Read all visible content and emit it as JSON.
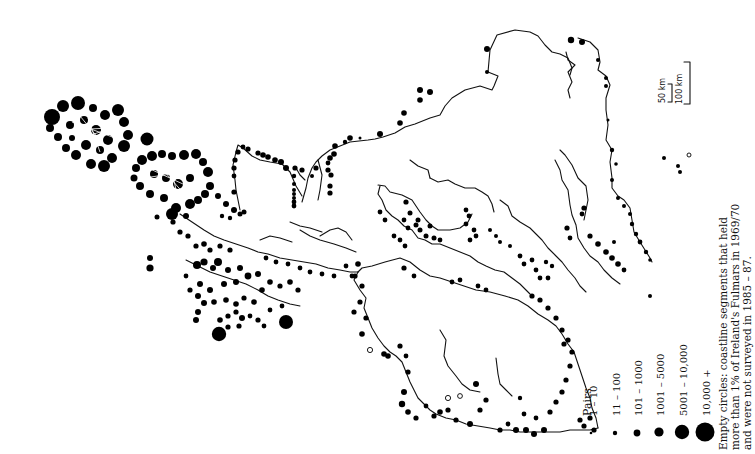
{
  "map": {
    "subject": "Fulmar breeding colonies, coastline of Ireland (rotated 90°)",
    "orientation": "rotated counter-clockwise",
    "legend": {
      "title": "Pairs",
      "classes": [
        {
          "label": "1 – 10",
          "radius": 1.3
        },
        {
          "label": "11 – 100",
          "radius": 2.2
        },
        {
          "label": "101 – 1000",
          "radius": 3.4
        },
        {
          "label": "1001 – 5000",
          "radius": 4.6
        },
        {
          "label": "5001 – 10,000",
          "radius": 7.2
        },
        {
          "label": "10,000 +",
          "radius": 9.5
        }
      ]
    },
    "note": {
      "line1": "Empty circles: coastline segments that held",
      "line2": "more than 1% of Ireland's Fulmars in 1969/70",
      "line3": "and were not surveyed in 1985 – 87."
    },
    "scale": {
      "short_label": "50 km",
      "long_label": "100 km"
    }
  }
}
